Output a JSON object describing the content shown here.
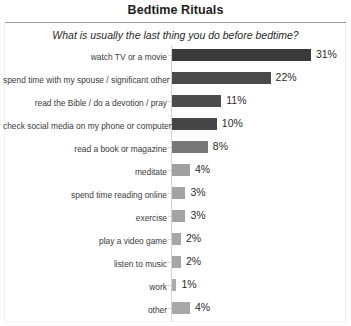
{
  "chart_data": {
    "type": "bar",
    "orientation": "horizontal",
    "title": "Bedtime Rituals",
    "subtitle": "What is usually the last thing you do before bedtime?",
    "xlabel": "",
    "ylabel": "",
    "xlim": [
      0,
      31
    ],
    "grid": false,
    "legend": false,
    "value_suffix": "%",
    "categories": [
      "watch TV or a movie",
      "spend time with my spouse / significant other",
      "read the Bible / do a devotion / pray",
      "check social media on my phone or computer",
      "read a book or magazine",
      "meditate",
      "spend time reading online",
      "exercise",
      "play a video game",
      "listen to music",
      "work",
      "other"
    ],
    "values": [
      31,
      22,
      11,
      10,
      8,
      4,
      3,
      3,
      2,
      2,
      1,
      4
    ],
    "value_labels": [
      "31%",
      "22%",
      "11%",
      "10%",
      "8%",
      "4%",
      "3%",
      "3%",
      "2%",
      "2%",
      "1%",
      "4%"
    ],
    "bar_colors": [
      "#3a3a3a",
      "#4a4a4a",
      "#4c4c4c",
      "#454545",
      "#777777",
      "#a0a0a0",
      "#a3a3a3",
      "#a3a3a3",
      "#a6a6a6",
      "#a6a6a6",
      "#ababab",
      "#a8a8a8"
    ]
  },
  "colors": {
    "title_text": "#1d1d1d",
    "subtitle_text": "#2a2a2a",
    "label_text": "#3a3a3a",
    "value_text": "#2b2b2b",
    "axis_line": "#d2d2d2",
    "rule_line": "#9a9a9a",
    "background": "#ffffff"
  }
}
